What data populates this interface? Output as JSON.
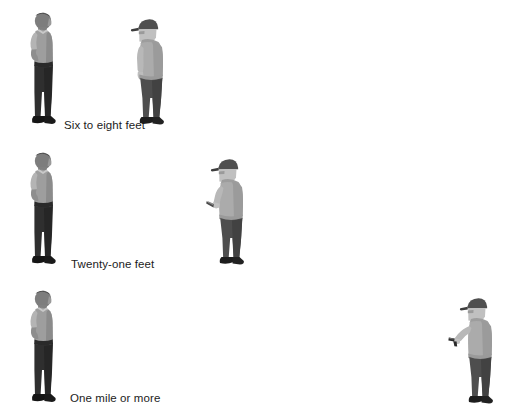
{
  "diagram": {
    "title_text": null,
    "background_color": "#ffffff",
    "text_color": "#1c1c1c",
    "rows": [
      {
        "id": "row-six-to-eight-feet",
        "caption": "Six to eight feet",
        "caption_x": 64,
        "caption_y": 119,
        "officer": {
          "name": "police-officer-figure",
          "pose": "hands-on-hips-facing-right",
          "x": 25,
          "y": 12,
          "width": 46,
          "height": 114,
          "shirt_color": "#9a9a9a",
          "pants_color": "#2e2e2e",
          "skin_color": "#8d8d8d",
          "shoe_color": "#181818"
        },
        "subject": {
          "name": "hooded-subject-figure",
          "pose": "arms-at-sides-facing-left",
          "weapon": "none",
          "x": 130,
          "y": 18,
          "width": 40,
          "height": 108,
          "hoodie_color": "#a8a8a8",
          "pants_color": "#4a4a4a",
          "cap_color": "#4d4d4d",
          "skin_color": "#c2c2c2",
          "shoe_color": "#1d1d1d"
        }
      },
      {
        "id": "row-twenty-one-feet",
        "caption": "Twenty-one feet",
        "caption_x": 71,
        "caption_y": 258,
        "officer": {
          "name": "police-officer-figure",
          "pose": "hands-on-hips-facing-right",
          "x": 25,
          "y": 152,
          "width": 46,
          "height": 114,
          "shirt_color": "#9a9a9a",
          "pants_color": "#2e2e2e",
          "skin_color": "#8d8d8d",
          "shoe_color": "#181818"
        },
        "subject": {
          "name": "knife-subject-figure",
          "pose": "knife-extended-facing-left",
          "weapon": "knife",
          "x": 206,
          "y": 158,
          "width": 42,
          "height": 108,
          "hoodie_color": "#a8a8a8",
          "pants_color": "#4a4a4a",
          "cap_color": "#4d4d4d",
          "skin_color": "#c2c2c2",
          "shoe_color": "#1d1d1d",
          "weapon_color": "#3a3a3a"
        }
      },
      {
        "id": "row-one-mile-or-more",
        "caption": "One mile or more",
        "caption_x": 70,
        "caption_y": 392,
        "officer": {
          "name": "police-officer-figure",
          "pose": "hands-on-hips-facing-right",
          "x": 25,
          "y": 290,
          "width": 46,
          "height": 114,
          "shirt_color": "#9a9a9a",
          "pants_color": "#2e2e2e",
          "skin_color": "#8d8d8d",
          "shoe_color": "#181818"
        },
        "subject": {
          "name": "gun-subject-figure",
          "pose": "gun-aimed-facing-left",
          "weapon": "handgun",
          "x": 448,
          "y": 297,
          "width": 44,
          "height": 108,
          "hoodie_color": "#a8a8a8",
          "pants_color": "#4a4a4a",
          "cap_color": "#4d4d4d",
          "skin_color": "#c2c2c2",
          "shoe_color": "#1d1d1d",
          "weapon_color": "#2a2a2a"
        }
      }
    ]
  }
}
